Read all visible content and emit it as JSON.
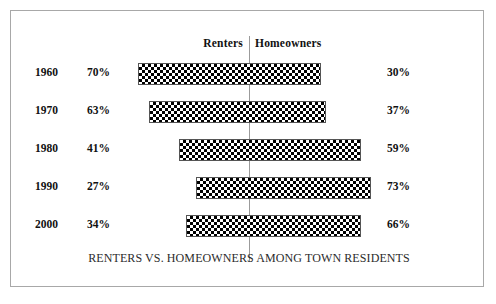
{
  "chart_data": {
    "type": "bar",
    "title": "RENTERS VS. HOMEOWNERS AMONG TOWN RESIDENTS",
    "subtitle": "",
    "xlabel": "",
    "ylabel": "",
    "orientation": "horizontal",
    "style": "diverging-population-pyramid",
    "grid": false,
    "legend_position": "top",
    "xlim": [
      0,
      100
    ],
    "categories": [
      "1960",
      "1970",
      "1980",
      "1990",
      "2000"
    ],
    "series": [
      {
        "name": "Renters",
        "values": [
          70,
          63,
          41,
          27,
          34
        ],
        "unit": "%"
      },
      {
        "name": "Homeowners",
        "values": [
          30,
          37,
          59,
          73,
          66
        ],
        "unit": "%"
      }
    ],
    "annotations": [
      "Bars are centered on a vertical divider; left portion is Renters, right portion is Homeowners.",
      "Each bar total spans 100% split between the two series."
    ]
  },
  "frame": {
    "border_color": "#a8a8a8",
    "background_color": "#ffffff"
  },
  "divider": {
    "name": "center-divider",
    "color": "#9b9b9b"
  },
  "headers": {
    "renters": "Renters",
    "homeowners": "Homeowners"
  },
  "rows": [
    {
      "year": "1960",
      "renter_pct": "70%",
      "home_pct": "30%",
      "bar_left_px": 137,
      "bar_width_px": 183
    },
    {
      "year": "1970",
      "renter_pct": "63%",
      "home_pct": "37%",
      "bar_left_px": 148,
      "bar_width_px": 177
    },
    {
      "year": "1980",
      "renter_pct": "41%",
      "home_pct": "59%",
      "bar_left_px": 178,
      "bar_width_px": 182
    },
    {
      "year": "1990",
      "renter_pct": "27%",
      "home_pct": "73%",
      "bar_left_px": 195,
      "bar_width_px": 175
    },
    {
      "year": "2000",
      "renter_pct": "34%",
      "home_pct": "66%",
      "bar_left_px": 185,
      "bar_width_px": 175
    }
  ],
  "title": "RENTERS VS. HOMEOWNERS AMONG TOWN RESIDENTS"
}
